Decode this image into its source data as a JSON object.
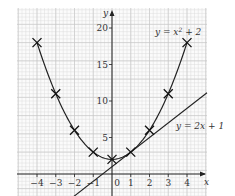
{
  "chart_data": {
    "type": "line",
    "title": "",
    "xlabel": "x",
    "ylabel": "y",
    "xlim": [
      -5,
      5
    ],
    "ylim": [
      -2,
      22
    ],
    "grid": true,
    "x_ticks": [
      -4,
      -3,
      -2,
      -1,
      0,
      1,
      2,
      3,
      4
    ],
    "x_tick_labels": [
      "−4",
      "−3",
      "−2",
      "−1",
      "0",
      "1",
      "2",
      "3",
      "4"
    ],
    "y_ticks": [
      5,
      10,
      15,
      20
    ],
    "y_tick_labels": [
      "5",
      "10",
      "15",
      "20"
    ],
    "series": [
      {
        "name": "y = x² + 2",
        "kind": "curve",
        "x": [
          -4,
          -3,
          -2,
          -1,
          0,
          1,
          2,
          3,
          4
        ],
        "values": [
          18,
          11,
          6,
          3,
          2,
          3,
          6,
          11,
          18
        ],
        "markers": "cross"
      },
      {
        "name": "y = 2x + 1",
        "kind": "line",
        "x": [
          -2,
          5
        ],
        "values": [
          -3,
          11
        ],
        "markers": "none"
      }
    ],
    "annotations": [
      {
        "text": "y = x² + 2",
        "near": "upper right of parabola"
      },
      {
        "text": "y = 2x + 1",
        "near": "right end of line"
      }
    ]
  },
  "labels": {
    "x_axis": "x",
    "y_axis": "y",
    "origin": "0",
    "curve_label": "y = x² + 2",
    "line_label": "y = 2x + 1"
  }
}
